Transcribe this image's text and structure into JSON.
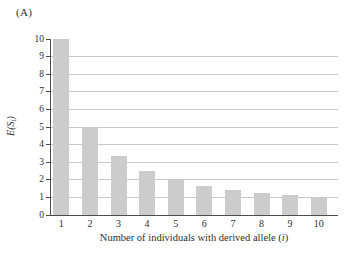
{
  "figure": {
    "label": "(A)"
  },
  "chart_data": {
    "type": "bar",
    "title": "",
    "categories": [
      "1",
      "2",
      "3",
      "4",
      "5",
      "6",
      "7",
      "8",
      "9",
      "10"
    ],
    "values": [
      10,
      5,
      3.33,
      2.5,
      2,
      1.67,
      1.43,
      1.25,
      1.11,
      1
    ],
    "xlabel": "Number of individuals with derived allele (i)",
    "xlabel_parts": {
      "pre": "Number of individuals with derived allele (",
      "italic": "i",
      "post": ")"
    },
    "ylabel": "E(Si)",
    "ylabel_parts": {
      "pre": "E(S",
      "sub": "i",
      "post": ")"
    },
    "ylim": [
      0,
      10
    ],
    "yticks": [
      0,
      1,
      2,
      3,
      4,
      5,
      6,
      7,
      8,
      9,
      10
    ],
    "gridlines_at": [
      1,
      2,
      3,
      4,
      5,
      6,
      7,
      8,
      9
    ],
    "grid": "horizontal",
    "legend": "none",
    "colors": {
      "bar": "#cccccc",
      "gridline": "#c9c9c9",
      "axis": "#4d4d4d",
      "text": "#2f2f2f",
      "background": "#ffffff"
    }
  }
}
